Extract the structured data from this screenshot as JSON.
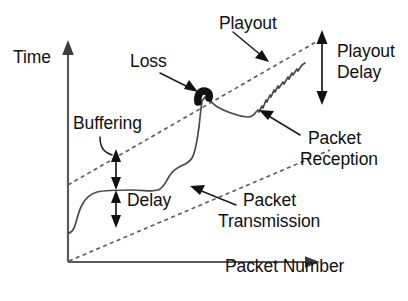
{
  "diagram": {
    "axes": {
      "y_label": "Time",
      "x_label": "Packet Number",
      "y_arrow_icon": "arrow-up-icon",
      "x_arrow_icon": "arrow-right-icon",
      "stroke_color": "#5a5a5a"
    },
    "labels": {
      "playout": "Playout",
      "loss": "Loss",
      "buffering": "Buffering",
      "delay": "Delay",
      "playout_delay": "Playout\nDelay",
      "playout_delay_line1": "Playout",
      "playout_delay_line2": "Delay",
      "packet_reception": "Packet\nReception",
      "packet_reception_line1": "Packet",
      "packet_reception_line2": "Reception",
      "packet_transmission": "Packet\nTransmission",
      "packet_transmission_line1": "Packet",
      "packet_transmission_line2": "Transmission"
    },
    "series": {
      "packet_transmission": {
        "name": "Packet Transmission",
        "style": "dashed",
        "color": "#5a5a5a",
        "description": "lower dashed line rising from origin"
      },
      "playout": {
        "name": "Playout",
        "style": "dashed",
        "color": "#5a5a5a",
        "description": "upper dashed line parallel to transmission line"
      },
      "packet_reception": {
        "name": "Packet Reception",
        "style": "solid",
        "color": "#4a4a4a",
        "description": "jittery solid curve between the two dashed lines"
      },
      "loss": {
        "name": "Loss",
        "style": "thick-blob",
        "color": "#111111",
        "description": "thick hook marking a lost packet where reception crosses playout line"
      }
    },
    "measures": [
      {
        "name": "buffering",
        "label": "Buffering",
        "orientation": "vertical",
        "double_headed": true
      },
      {
        "name": "delay",
        "label": "Delay",
        "orientation": "vertical",
        "double_headed": true
      },
      {
        "name": "playout-delay",
        "label": "Playout Delay",
        "orientation": "vertical",
        "double_headed": true
      }
    ]
  }
}
